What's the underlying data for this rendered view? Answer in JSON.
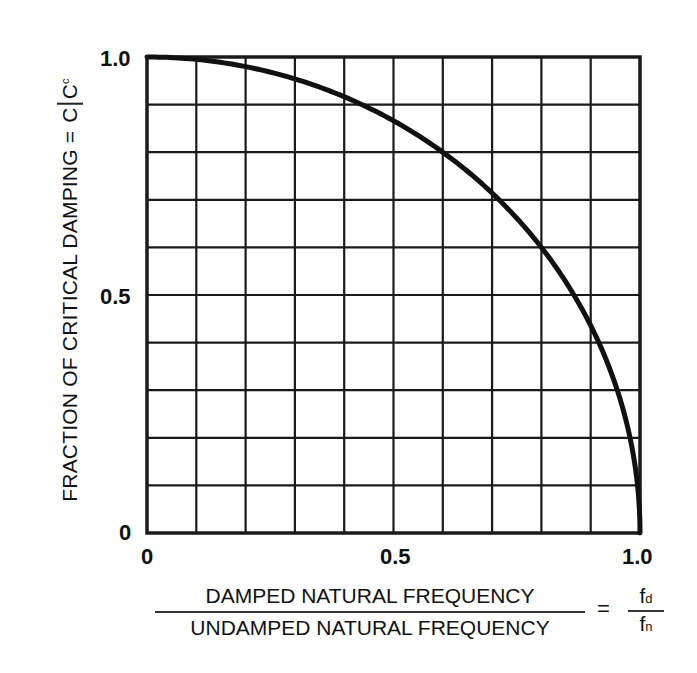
{
  "chart_data": {
    "type": "line",
    "title": "",
    "xlabel_numerator": "DAMPED NATURAL FREQUENCY",
    "xlabel_denominator": "UNDAMPED NATURAL FREQUENCY",
    "xlabel_symbol_num": "f",
    "xlabel_symbol_num_sub": "d",
    "xlabel_symbol_den": "f",
    "xlabel_symbol_den_sub": "n",
    "ylabel": "FRACTION OF CRITICAL DAMPING =",
    "ylabel_symbol_num": "C",
    "ylabel_symbol_den": "C",
    "ylabel_symbol_den_sub": "c",
    "equals": "=",
    "xlim": [
      0,
      1.0
    ],
    "ylim": [
      0,
      1.0
    ],
    "x_ticks": [
      "0",
      "0.5",
      "1.0"
    ],
    "y_ticks": [
      "0",
      "0.5",
      "1.0"
    ],
    "grid": true,
    "grid_divisions": 10,
    "series": [
      {
        "name": "C/Cc vs fd/fn",
        "x": [
          0,
          0.1,
          0.2,
          0.3,
          0.4,
          0.5,
          0.6,
          0.7,
          0.8,
          0.9,
          0.95,
          0.98,
          1.0
        ],
        "values": [
          1.0,
          0.995,
          0.98,
          0.954,
          0.917,
          0.866,
          0.8,
          0.714,
          0.6,
          0.436,
          0.312,
          0.199,
          0
        ]
      }
    ],
    "colors": {
      "line": "#111111",
      "grid": "#1a1a1a",
      "background": "#ffffff"
    }
  }
}
